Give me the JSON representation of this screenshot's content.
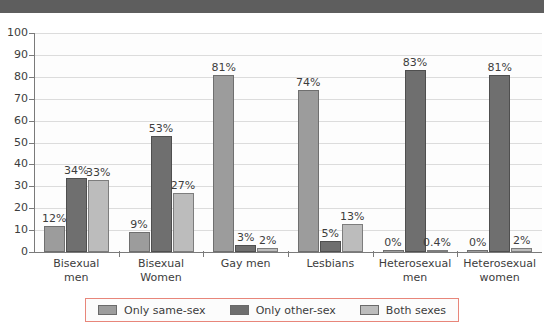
{
  "banner": {
    "present": true,
    "color": "#5e5e5e"
  },
  "legend": {
    "border_color": "#e8867a",
    "position": "bottom",
    "items": [
      {
        "label": "Only same-sex",
        "color": "#9c9c9c",
        "swatch_name": "legend-swatch-only-same-sex"
      },
      {
        "label": "Only other-sex",
        "color": "#6f6f6f",
        "swatch_name": "legend-swatch-only-other-sex"
      },
      {
        "label": "Both sexes",
        "color": "#bcbcbc",
        "swatch_name": "legend-swatch-both-sexes"
      }
    ]
  },
  "chart_data": {
    "type": "bar",
    "title": "",
    "xlabel": "",
    "ylabel": "",
    "ylim": [
      0,
      100
    ],
    "yticks": [
      0,
      10,
      20,
      30,
      40,
      50,
      60,
      70,
      80,
      90,
      100
    ],
    "grid": true,
    "legend_position": "bottom",
    "categories": [
      "Bisexual men",
      "Bisexual Women",
      "Gay men",
      "Lesbians",
      "Heterosexual men",
      "Heterosexual women"
    ],
    "category_lines": [
      [
        "Bisexual",
        "men"
      ],
      [
        "Bisexual",
        "Women"
      ],
      [
        "Gay men",
        ""
      ],
      [
        "Lesbians",
        ""
      ],
      [
        "Heterosexual",
        "men"
      ],
      [
        "Heterosexual",
        "women"
      ]
    ],
    "series": [
      {
        "name": "Only same-sex",
        "color": "#9c9c9c",
        "values": [
          12,
          9,
          81,
          74,
          0,
          0
        ],
        "labels": [
          "12%",
          "9%",
          "81%",
          "74%",
          "0%",
          "0%"
        ]
      },
      {
        "name": "Only other-sex",
        "color": "#6f6f6f",
        "values": [
          34,
          53,
          3,
          5,
          83,
          81
        ],
        "labels": [
          "34%",
          "53%",
          "3%",
          "5%",
          "83%",
          "81%"
        ]
      },
      {
        "name": "Both sexes",
        "color": "#bcbcbc",
        "values": [
          33,
          27,
          2,
          13,
          0.4,
          2
        ],
        "labels": [
          "33%",
          "27%",
          "2%",
          "13%",
          "0.4%",
          "2%"
        ]
      }
    ]
  }
}
